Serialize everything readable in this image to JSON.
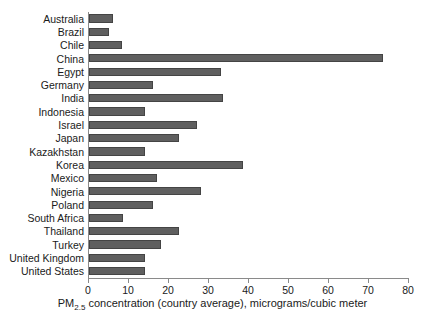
{
  "chart_data": {
    "type": "bar",
    "orientation": "horizontal",
    "title": "",
    "xlabel_parts": {
      "pre": "PM",
      "sub": "2.5",
      "post": " concentration (country average), micrograms/cubic meter"
    },
    "xlabel": "PM2.5 concentration (country average), micrograms/cubic meter",
    "ylabel": "",
    "xlim": [
      0,
      80
    ],
    "xticks": [
      0,
      10,
      20,
      30,
      40,
      50,
      60,
      70,
      80
    ],
    "xtick_labels": [
      "0",
      "10",
      "20",
      "30",
      "40",
      "50",
      "60",
      "70",
      "80"
    ],
    "grid": false,
    "legend": false,
    "bar_color": "#5f5f5f",
    "axis_color": "#8a8a8a",
    "categories": [
      "Australia",
      "Brazil",
      "Chile",
      "China",
      "Egypt",
      "Germany",
      "India",
      "Indonesia",
      "Israel",
      "Japan",
      "Kazakhstan",
      "Korea",
      "Mexico",
      "Nigeria",
      "Poland",
      "South Africa",
      "Thailand",
      "Turkey",
      "United Kingdom",
      "United States"
    ],
    "values": [
      6,
      5,
      8.3,
      73.5,
      33,
      16,
      33.5,
      14,
      27,
      22.5,
      14,
      38.5,
      17,
      28,
      16,
      8.5,
      22.5,
      18,
      14,
      14
    ]
  }
}
